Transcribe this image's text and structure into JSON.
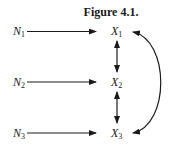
{
  "figure": {
    "title": "Figure 4.1.",
    "nodes": [
      {
        "id": "N1",
        "letter": "N",
        "sub": "1"
      },
      {
        "id": "N2",
        "letter": "N",
        "sub": "2"
      },
      {
        "id": "N3",
        "letter": "N",
        "sub": "3"
      },
      {
        "id": "X1",
        "letter": "X",
        "sub": "1"
      },
      {
        "id": "X2",
        "letter": "X",
        "sub": "2"
      },
      {
        "id": "X3",
        "letter": "X",
        "sub": "3"
      }
    ],
    "edges": [
      {
        "from": "N1",
        "to": "X1",
        "type": "directed"
      },
      {
        "from": "N2",
        "to": "X2",
        "type": "directed"
      },
      {
        "from": "N3",
        "to": "X3",
        "type": "directed"
      },
      {
        "from": "X1",
        "to": "X2",
        "type": "bidirected"
      },
      {
        "from": "X2",
        "to": "X3",
        "type": "bidirected"
      },
      {
        "from": "X1",
        "to": "X3",
        "type": "bidirected-curved"
      }
    ]
  }
}
